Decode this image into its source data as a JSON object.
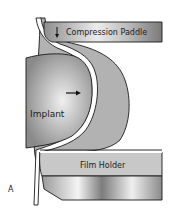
{
  "diagram": {
    "panel_label": "A",
    "labels": {
      "compression_paddle": "Compression Paddle",
      "implant": "Implant",
      "film_holder": "Film Holder"
    },
    "arrows": {
      "paddle_direction": "down",
      "implant_direction": "right"
    },
    "colors": {
      "tissue": "#b4b4b4",
      "implant_light": "#e8e8e8",
      "implant_dark": "#8c8c8c",
      "paddle": "#a8a8a8",
      "outline": "#1a1a1a"
    }
  }
}
